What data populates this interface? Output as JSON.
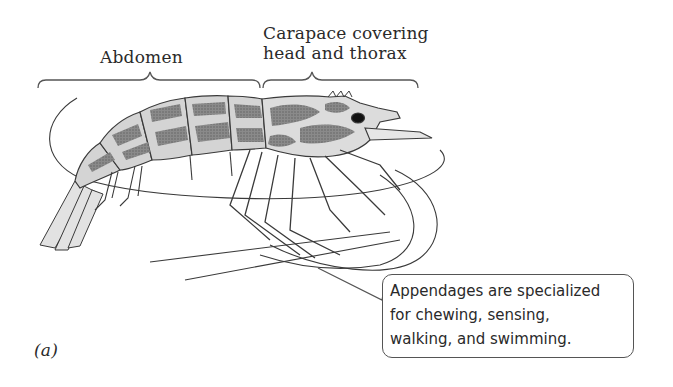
{
  "figure": {
    "panel_label": "(a)",
    "labels": {
      "abdomen": "Abdomen",
      "carapace_line1": "Carapace covering",
      "carapace_line2": "head and thorax"
    },
    "callout": {
      "lines": [
        "Appendages are specialized",
        "for chewing, sensing,",
        "walking, and swimming."
      ]
    },
    "colors": {
      "outline": "#3a3a3a",
      "dark_pattern": "#7a7a7a",
      "light_body": "#d8d8d8",
      "background": "#ffffff"
    }
  }
}
